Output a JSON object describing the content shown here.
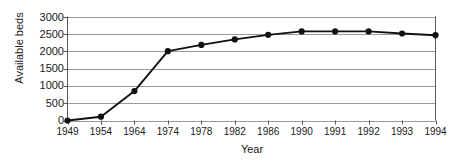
{
  "chart_data": {
    "type": "line",
    "title": "",
    "xlabel": "Year",
    "ylabel": "Available beds",
    "categories": [
      "1949",
      "1954",
      "1964",
      "1974",
      "1978",
      "1982",
      "1986",
      "1990",
      "1991",
      "1992",
      "1993",
      "1994"
    ],
    "values": [
      0,
      110,
      850,
      2000,
      2180,
      2340,
      2470,
      2570,
      2570,
      2570,
      2510,
      2460
    ],
    "series": [
      {
        "name": "Available beds",
        "values": [
          0,
          110,
          850,
          2000,
          2180,
          2340,
          2470,
          2570,
          2570,
          2570,
          2510,
          2460
        ]
      }
    ],
    "ylim": [
      0,
      3000
    ],
    "yticks": [
      0,
      500,
      1000,
      1500,
      2000,
      2500,
      3000
    ],
    "ytick_labels": [
      "0",
      "500",
      "1000",
      "1500",
      "2000",
      "2500",
      "3000"
    ],
    "grid": "horizontal",
    "legend": "none",
    "marker": "filled-circle",
    "line_color": "#111111",
    "grid_color": "#9a9a9a",
    "axis_color": "#555555"
  }
}
